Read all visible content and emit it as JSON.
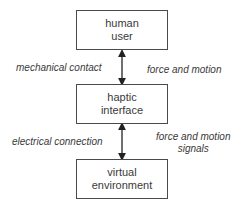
{
  "diagram": {
    "nodes": [
      {
        "id": "human-user",
        "lines": [
          "human",
          "user"
        ]
      },
      {
        "id": "haptic-interface",
        "lines": [
          "haptic",
          "interface"
        ]
      },
      {
        "id": "virtual-environment",
        "lines": [
          "virtual",
          "environment"
        ]
      }
    ],
    "edges": [
      {
        "from": "human-user",
        "to": "haptic-interface",
        "direction": "bidirectional",
        "left_label": "mechanical contact",
        "right_label": [
          "force and motion"
        ]
      },
      {
        "from": "haptic-interface",
        "to": "virtual-environment",
        "direction": "bidirectional",
        "left_label": "electrical connection",
        "right_label": [
          "force and motion",
          "signals"
        ]
      }
    ],
    "colors": {
      "stroke": "#4a4a4a",
      "text": "#3a3a3a",
      "background": "#ffffff"
    }
  }
}
